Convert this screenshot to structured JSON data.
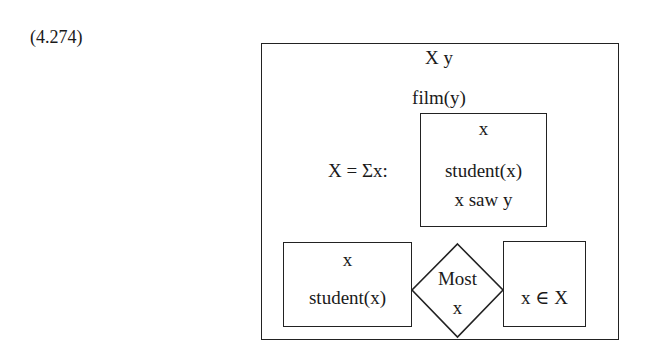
{
  "equation_number": "(4.274)",
  "outer_box": {
    "referents": "X  y",
    "conditions": [
      "film(y)"
    ]
  },
  "abstraction": {
    "label": "X = Σx:",
    "box": {
      "referent": "x",
      "conditions": [
        "student(x)",
        "x saw y"
      ]
    }
  },
  "duplex": {
    "restrictor": {
      "referent": "x",
      "condition": "student(x)"
    },
    "quantifier": {
      "determiner": "Most",
      "variable": "x"
    },
    "scope": {
      "condition": "x ∈ X"
    }
  }
}
